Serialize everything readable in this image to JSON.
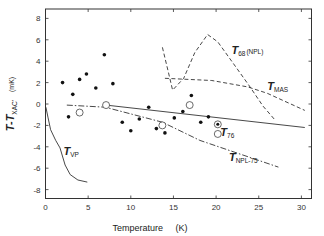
{
  "chart_data": {
    "type": "scatter",
    "title": "",
    "xlabel": "Temperature",
    "xlabel_unit": "(K)",
    "ylabel": "T-T",
    "ylabel_sub": "XAC'",
    "ylabel_unit": "(mK)",
    "xlim": [
      0,
      31
    ],
    "ylim": [
      -9,
      9
    ],
    "x_ticks": [
      0,
      5,
      10,
      15,
      20,
      25,
      30
    ],
    "y_ticks": [
      -8,
      -6,
      -4,
      -2,
      0,
      2,
      4,
      6,
      8
    ],
    "grid": false,
    "series": [
      {
        "name": "filled points",
        "kind": "points-filled",
        "points": [
          [
            2.0,
            2.0
          ],
          [
            4.0,
            2.3
          ],
          [
            4.8,
            2.8
          ],
          [
            6.9,
            4.6
          ],
          [
            5.9,
            1.5
          ],
          [
            7.9,
            1.9
          ],
          [
            3.2,
            0.9
          ],
          [
            2.7,
            -1.2
          ],
          [
            12.1,
            -0.3
          ],
          [
            16.1,
            -0.7
          ],
          [
            17.1,
            0.8
          ],
          [
            9.0,
            -1.7
          ],
          [
            10.0,
            -2.5
          ],
          [
            11.0,
            -1.4
          ],
          [
            13.0,
            -2.3
          ],
          [
            14.0,
            -2.7
          ],
          [
            15.1,
            -1.3
          ],
          [
            18.2,
            -1.7
          ],
          [
            19.1,
            -1.2
          ]
        ]
      },
      {
        "name": "open circles",
        "kind": "points-open",
        "points": [
          [
            4.0,
            -0.8
          ],
          [
            7.1,
            -0.1
          ],
          [
            13.7,
            -2.0
          ],
          [
            16.9,
            -0.1
          ],
          [
            20.2,
            -2.8
          ]
        ]
      },
      {
        "name": "circled dot",
        "kind": "points-circled",
        "points": [
          [
            20.2,
            -1.9
          ]
        ]
      },
      {
        "name": "T76",
        "label": "T",
        "label_sub": "76",
        "kind": "line-solid",
        "points": [
          [
            7.1,
            -0.1
          ],
          [
            30.4,
            -2.2
          ]
        ],
        "label_at": [
          20.5,
          -3.0
        ]
      },
      {
        "name": "TNPL-75",
        "label": "T",
        "label_sub": "NPL-75",
        "kind": "line-dashdot",
        "points": [
          [
            2.5,
            -0.1
          ],
          [
            7.0,
            -0.3
          ],
          [
            13.7,
            -1.7
          ],
          [
            18.1,
            -3.4
          ],
          [
            27.3,
            -5.9
          ]
        ],
        "label_at": [
          21.5,
          -5.3
        ]
      },
      {
        "name": "TMAS",
        "label": "T",
        "label_sub": "MAS",
        "kind": "line-dashed",
        "points": [
          [
            14.0,
            2.4
          ],
          [
            19.5,
            2.2
          ],
          [
            23.7,
            1.6
          ],
          [
            26.0,
            1.0
          ],
          [
            30.4,
            -0.6
          ]
        ],
        "label_at": [
          26.0,
          1.3
        ]
      },
      {
        "name": "T68(NPL)",
        "label": "T",
        "label_sub": "68",
        "label_extra": "(NPL)",
        "kind": "line-dashed",
        "points": [
          [
            13.7,
            5.3
          ],
          [
            14.4,
            3.0
          ],
          [
            14.9,
            1.3
          ],
          [
            16.2,
            2.4
          ],
          [
            17.5,
            4.8
          ],
          [
            19.0,
            6.5
          ],
          [
            20.2,
            5.8
          ],
          [
            22.0,
            3.8
          ],
          [
            23.8,
            1.8
          ],
          [
            25.5,
            -0.2
          ],
          [
            26.9,
            -1.5
          ]
        ],
        "label_at": [
          21.8,
          4.7
        ]
      },
      {
        "name": "TVP",
        "label": "T",
        "label_sub": "VP",
        "kind": "line-solid",
        "points": [
          [
            0.05,
            -0.3
          ],
          [
            0.3,
            -1.3
          ],
          [
            0.6,
            -2.4
          ],
          [
            1.2,
            -3.4
          ],
          [
            1.7,
            -4.1
          ],
          [
            2.3,
            -5.7
          ],
          [
            2.9,
            -6.6
          ],
          [
            3.8,
            -7.1
          ],
          [
            4.9,
            -7.3
          ]
        ],
        "label_at": [
          2.1,
          -4.8
        ]
      }
    ]
  }
}
